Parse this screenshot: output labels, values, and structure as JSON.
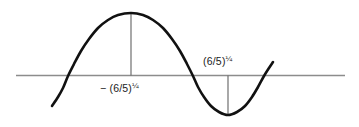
{
  "figure": {
    "width": 359,
    "height": 127,
    "background_color": "#ffffff"
  },
  "labels": {
    "left": {
      "full_text": "− (6/5)¼",
      "base": "− (6/5)",
      "exponent": "¼",
      "meaning": "negative fourth root of six fifths",
      "position": "below-axis-at-maximum"
    },
    "right": {
      "full_text": "(6/5)¼",
      "base": "(6/5)",
      "exponent": "¼",
      "meaning": "fourth root of six fifths",
      "position": "above-axis-at-minimum"
    }
  },
  "chart_data": {
    "type": "line",
    "title": "",
    "xlabel": "",
    "ylabel": "",
    "grid": false,
    "legend": false,
    "axis": {
      "horizontal_axis_y_px": 75.5,
      "x_start_px": 16,
      "x_end_px": 345,
      "color": "#8c8c8c",
      "width_px": 1.4
    },
    "curve": {
      "color": "#111111",
      "width_px": 2.6,
      "x_start_px": 52,
      "x_end_px": 273,
      "points_px": [
        [
          52,
          106
        ],
        [
          58,
          97
        ],
        [
          63,
          88
        ],
        [
          68,
          76
        ],
        [
          74,
          64
        ],
        [
          81,
          51
        ],
        [
          89,
          39
        ],
        [
          98,
          28
        ],
        [
          108,
          20
        ],
        [
          118,
          15
        ],
        [
          131,
          13
        ],
        [
          143,
          15
        ],
        [
          153,
          20
        ],
        [
          163,
          28
        ],
        [
          172,
          39
        ],
        [
          180,
          51
        ],
        [
          187,
          64
        ],
        [
          193,
          76
        ],
        [
          198,
          87
        ],
        [
          204,
          97
        ],
        [
          211,
          106
        ],
        [
          219,
          112
        ],
        [
          228,
          115
        ],
        [
          237,
          112
        ],
        [
          245,
          106
        ],
        [
          252,
          97
        ],
        [
          258,
          87
        ],
        [
          264,
          76
        ],
        [
          269,
          68
        ],
        [
          273,
          62
        ]
      ]
    },
    "markers": [
      {
        "name": "maximum",
        "x_px": 131,
        "y_px": 13,
        "tick_from_y_px": 13,
        "tick_to_y_px": 75.5,
        "label": "− (6/5)¼",
        "label_side": "below-axis"
      },
      {
        "name": "minimum",
        "x_px": 228,
        "y_px": 115,
        "tick_from_y_px": 75.5,
        "tick_to_y_px": 115,
        "label": "(6/5)¼",
        "label_side": "above-axis"
      }
    ],
    "tick_line": {
      "color": "#6f6f6f",
      "width_px": 1.2
    },
    "colors": {
      "curve": "#111111",
      "axis": "#8c8c8c",
      "tick": "#6f6f6f",
      "text": "#1a1a1a",
      "background": "#ffffff"
    }
  }
}
